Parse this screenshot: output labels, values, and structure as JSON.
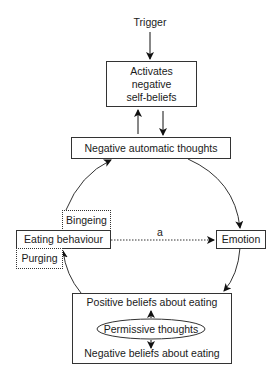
{
  "diagram": {
    "trigger": "Trigger",
    "activates_box": "Activates negative self-beliefs",
    "activates_lines": [
      "Activates",
      "negative",
      "self-beliefs"
    ],
    "nat_box": "Negative automatic thoughts",
    "eating_behaviour": "Eating behaviour",
    "bingeing": "Bingeing",
    "purging": "Purging",
    "emotion": "Emotion",
    "edge_label_a": "a",
    "beliefs_box": {
      "positive": "Positive beliefs about eating",
      "permissive": "Permissive thoughts",
      "negative": "Negative beliefs about eating"
    }
  },
  "edges": [
    {
      "from": "Trigger",
      "to": "Activates negative self-beliefs"
    },
    {
      "from": "Negative automatic thoughts",
      "to": "Activates negative self-beliefs"
    },
    {
      "from": "Activates negative self-beliefs",
      "to": "Negative automatic thoughts"
    },
    {
      "from": "Negative automatic thoughts",
      "to": "Emotion"
    },
    {
      "from": "Emotion",
      "to": "Positive/Negative beliefs about eating"
    },
    {
      "from": "Positive/Negative beliefs about eating",
      "to": "Eating behaviour"
    },
    {
      "from": "Eating behaviour",
      "to": "Negative automatic thoughts"
    },
    {
      "from": "Eating behaviour",
      "to": "Emotion",
      "style": "dotted",
      "label": "a"
    }
  ]
}
